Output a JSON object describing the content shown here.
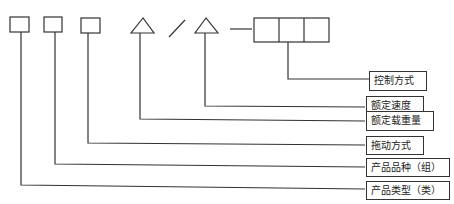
{
  "diagram": {
    "type": "model-code-structure",
    "code_symbols": [
      {
        "shape": "square",
        "meaning_ref": 5
      },
      {
        "shape": "square",
        "meaning_ref": 4
      },
      {
        "shape": "square",
        "meaning_ref": 3
      },
      {
        "shape": "triangle",
        "meaning_ref": 2
      },
      {
        "shape": "slash"
      },
      {
        "shape": "triangle",
        "meaning_ref": 1
      },
      {
        "shape": "dash"
      },
      {
        "shape": "triple-box",
        "meaning_ref": 0
      }
    ],
    "labels": [
      "控制方式",
      "额定速度",
      "额定载重量",
      "拖动方式",
      "产品品种（组）",
      "产品类型（类）"
    ]
  }
}
